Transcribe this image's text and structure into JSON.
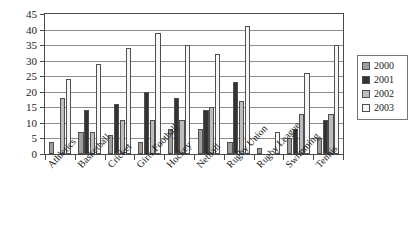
{
  "chart_data": {
    "type": "bar",
    "title": "",
    "xlabel": "",
    "ylabel": "",
    "ylim": [
      0,
      45
    ],
    "y_ticks": [
      0,
      5,
      10,
      15,
      20,
      25,
      30,
      35,
      40,
      45
    ],
    "grid": true,
    "legend_position": "right",
    "categories": [
      "Athletics",
      "Basketball",
      "Cricket",
      "Girls Football",
      "Hockey",
      "Netball",
      "Rugby Union",
      "Rugby League",
      "Swimming",
      "Tennis"
    ],
    "series": [
      {
        "name": "2000",
        "color": "#9e9e9e",
        "values": [
          4,
          7,
          6,
          4,
          8,
          8,
          4,
          2,
          5,
          5
        ]
      },
      {
        "name": "2001",
        "color": "#333333",
        "values": [
          0,
          14,
          16,
          20,
          18,
          14,
          23,
          0,
          8,
          11
        ]
      },
      {
        "name": "2002",
        "color": "#bdbdbd",
        "values": [
          18,
          7,
          11,
          11,
          11,
          15,
          17,
          0,
          13,
          13
        ]
      },
      {
        "name": "2003",
        "color": "#f7f7f7",
        "values": [
          24,
          29,
          34,
          39,
          35,
          32,
          41,
          7,
          26,
          35
        ]
      }
    ]
  },
  "legend": {
    "items": [
      {
        "label": "2000"
      },
      {
        "label": "2001"
      },
      {
        "label": "2002"
      },
      {
        "label": "2003"
      }
    ]
  }
}
